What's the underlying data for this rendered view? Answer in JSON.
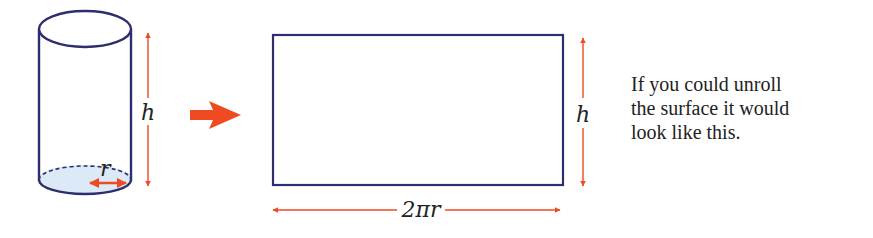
{
  "colors": {
    "outline": "#2e2d6e",
    "arrow": "#f04a22",
    "base_fill": "#dbeaf6",
    "text": "#222222"
  },
  "cylinder": {
    "height_label": "h",
    "radius_label": "r"
  },
  "transform_arrow": {
    "icon": "right-arrow-icon"
  },
  "rectangle": {
    "height_label": "h",
    "width_label": "2πr"
  },
  "caption": {
    "lines": [
      "If you could unroll",
      "the surface it would",
      "look like this."
    ]
  }
}
